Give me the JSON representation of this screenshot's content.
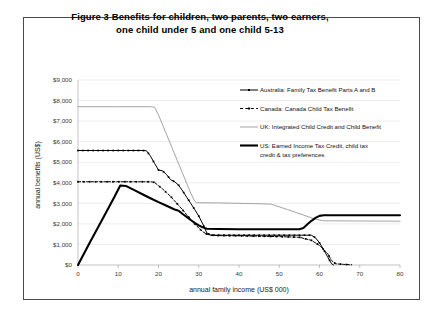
{
  "figure": {
    "title_line1": "Figure 3   Benefits for children, two parents, two earners,",
    "title_line2": "one child under 5 and one child 5-13"
  },
  "chart_data": {
    "type": "line",
    "title": "Figure 3   Benefits for children, two parents, two earners, one child under 5 and one child 5-13",
    "xlabel": "annual family income (US$ 000)",
    "ylabel": "annual benefits (US$)",
    "xlim": [
      0,
      80
    ],
    "ylim": [
      0,
      9000
    ],
    "xticks": [
      0,
      10,
      20,
      30,
      40,
      50,
      60,
      70,
      80
    ],
    "xticklabels": [
      "0",
      "10",
      "20",
      "30",
      "40",
      "50",
      "60",
      "70",
      "80"
    ],
    "yticks": [
      0,
      1000,
      2000,
      3000,
      4000,
      5000,
      6000,
      7000,
      8000,
      9000
    ],
    "yticklabels": [
      "$0",
      "$1,000",
      "$2,000",
      "$3,000",
      "$4,000",
      "$5,000",
      "$6,000",
      "$7,000",
      "$8,000",
      "$9,000"
    ],
    "grid": true,
    "legend_position": "upper right",
    "series": [
      {
        "name": "Australia: Family Tax Benefit Parts A and B",
        "style": "solid-thin-square-markers",
        "color": "#000000",
        "points": [
          [
            0,
            5570
          ],
          [
            4,
            5570
          ],
          [
            8,
            5570
          ],
          [
            12,
            5570
          ],
          [
            16,
            5570
          ],
          [
            17,
            5560
          ],
          [
            18,
            5300
          ],
          [
            19,
            4950
          ],
          [
            20,
            4620
          ],
          [
            21,
            4580
          ],
          [
            22,
            4400
          ],
          [
            23,
            4150
          ],
          [
            24,
            4050
          ],
          [
            25,
            3880
          ],
          [
            26,
            3600
          ],
          [
            27,
            3300
          ],
          [
            28,
            3000
          ],
          [
            29,
            2700
          ],
          [
            30,
            2380
          ],
          [
            31,
            2000
          ],
          [
            32,
            1560
          ],
          [
            33,
            1450
          ],
          [
            36,
            1450
          ],
          [
            40,
            1450
          ],
          [
            45,
            1450
          ],
          [
            50,
            1450
          ],
          [
            55,
            1450
          ],
          [
            58,
            1450
          ],
          [
            59,
            1320
          ],
          [
            60,
            1080
          ],
          [
            61,
            760
          ],
          [
            62,
            400
          ],
          [
            63,
            60
          ],
          [
            63.5,
            0
          ]
        ]
      },
      {
        "name": "Canada: Canada Child Tax Benefit",
        "style": "dashed-square-markers",
        "color": "#000000",
        "points": [
          [
            0,
            4050
          ],
          [
            5,
            4050
          ],
          [
            10,
            4050
          ],
          [
            15,
            4050
          ],
          [
            18,
            4050
          ],
          [
            19,
            4020
          ],
          [
            20,
            3860
          ],
          [
            21,
            3700
          ],
          [
            22,
            3520
          ],
          [
            23,
            3340
          ],
          [
            24,
            3120
          ],
          [
            25,
            2900
          ],
          [
            26,
            2680
          ],
          [
            27,
            2450
          ],
          [
            28,
            2220
          ],
          [
            29,
            2000
          ],
          [
            30,
            1800
          ],
          [
            31,
            1620
          ],
          [
            32,
            1500
          ],
          [
            33,
            1450
          ],
          [
            35,
            1430
          ],
          [
            40,
            1420
          ],
          [
            45,
            1400
          ],
          [
            50,
            1380
          ],
          [
            55,
            1350
          ],
          [
            58,
            1200
          ],
          [
            60,
            950
          ],
          [
            62,
            560
          ],
          [
            63,
            220
          ],
          [
            64,
            60
          ],
          [
            66,
            30
          ],
          [
            68,
            10
          ]
        ]
      },
      {
        "name": "UK: Integrated Child Credit and Child Benefit",
        "style": "solid-thin",
        "color": "#9a9a9a",
        "points": [
          [
            0,
            7700
          ],
          [
            10,
            7700
          ],
          [
            18,
            7700
          ],
          [
            19,
            7680
          ],
          [
            20,
            7300
          ],
          [
            22,
            6350
          ],
          [
            24,
            5400
          ],
          [
            26,
            4450
          ],
          [
            28,
            3500
          ],
          [
            29,
            3100
          ],
          [
            29.5,
            3030
          ],
          [
            35,
            3020
          ],
          [
            40,
            3000
          ],
          [
            45,
            2980
          ],
          [
            48,
            2960
          ],
          [
            52,
            2700
          ],
          [
            56,
            2430
          ],
          [
            59,
            2230
          ],
          [
            61,
            2150
          ],
          [
            70,
            2140
          ],
          [
            80,
            2130
          ]
        ]
      },
      {
        "name": "US: Earned Income Tax Credit, child tax credit & tax preferences",
        "style": "solid-thick",
        "color": "#000000",
        "points": [
          [
            0,
            0
          ],
          [
            3,
            1120
          ],
          [
            6,
            2200
          ],
          [
            9,
            3300
          ],
          [
            10.5,
            3870
          ],
          [
            12,
            3840
          ],
          [
            14,
            3640
          ],
          [
            16,
            3440
          ],
          [
            18,
            3250
          ],
          [
            20,
            3060
          ],
          [
            22,
            2880
          ],
          [
            24,
            2700
          ],
          [
            25,
            2640
          ],
          [
            26,
            2480
          ],
          [
            27,
            2340
          ],
          [
            28,
            2190
          ],
          [
            29,
            2050
          ],
          [
            30,
            1930
          ],
          [
            31,
            1830
          ],
          [
            32,
            1760
          ],
          [
            35,
            1750
          ],
          [
            40,
            1740
          ],
          [
            45,
            1740
          ],
          [
            50,
            1740
          ],
          [
            55,
            1740
          ],
          [
            56,
            1800
          ],
          [
            57,
            1980
          ],
          [
            58,
            2150
          ],
          [
            59,
            2290
          ],
          [
            60,
            2390
          ],
          [
            61,
            2420
          ],
          [
            70,
            2420
          ],
          [
            80,
            2420
          ]
        ]
      }
    ]
  },
  "legend": {
    "items": [
      {
        "label": "Australia: Family Tax Benefit Parts A and B",
        "swatch": "line-with-square-marker"
      },
      {
        "label": "Canada: Canada Child Tax Benefit",
        "swatch": "dashed-line-with-marker"
      },
      {
        "label": "UK: Integrated Child Credit and Child Benefit",
        "swatch": "thin-gray-line"
      },
      {
        "label": "US: Earned Income Tax Credit, child tax",
        "swatch": "thick-black-line"
      },
      {
        "label": "credit & tax preferences",
        "swatch": "none"
      }
    ]
  }
}
